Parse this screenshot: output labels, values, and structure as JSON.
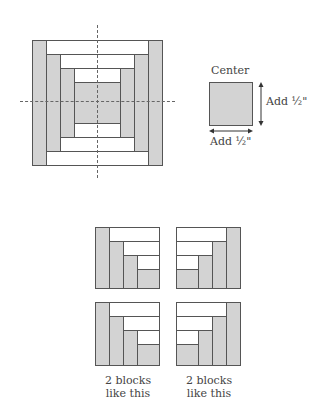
{
  "main_block": {
    "description": "Log cabin quilt block with center square and three rings of strips",
    "colors": {
      "dark_fill": "#d3d3d3",
      "light_fill": "#ffffff",
      "outline": "#555555",
      "guide_line": "#666666"
    },
    "guides": [
      "vertical-center-dashed",
      "horizontal-center-dashed"
    ]
  },
  "center_detail": {
    "title": "Center",
    "vertical_label": "Add ½\"",
    "horizontal_label": "Add ½\""
  },
  "sub_blocks": {
    "items": [
      {
        "position": "top-left",
        "orientation": "gray-strips-left"
      },
      {
        "position": "top-right",
        "orientation": "gray-strips-right"
      },
      {
        "position": "bottom-left",
        "orientation": "gray-strips-left"
      },
      {
        "position": "bottom-right",
        "orientation": "gray-strips-right"
      }
    ],
    "captions": [
      {
        "line1": "2 blocks",
        "line2": "like this"
      },
      {
        "line1": "2 blocks",
        "line2": "like this"
      }
    ]
  }
}
